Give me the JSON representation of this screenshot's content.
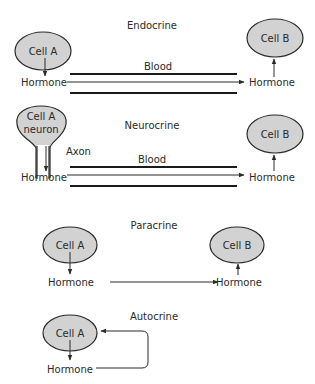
{
  "diagram": {
    "type": "cell-signaling-modes",
    "colors": {
      "cell_fill": "#d2d2d2",
      "stroke": "#2a2a2a",
      "background": "#ffffff"
    },
    "panels": [
      {
        "title": "Endocrine",
        "source_cell": "Cell A",
        "target_cell": "Cell B",
        "source_product": "Hormone",
        "target_product": "Hormone",
        "vessel_label": "Blood"
      },
      {
        "title": "Neurocrine",
        "source_cell_line1": "Cell A",
        "source_cell_line2": "neuron",
        "axon_label": "Axon",
        "target_cell": "Cell B",
        "source_product": "Hormone",
        "target_product": "Hormone",
        "vessel_label": "Blood"
      },
      {
        "title": "Paracrine",
        "source_cell": "Cell A",
        "target_cell": "Cell B",
        "source_product": "Hormone",
        "target_product": "Hormone"
      },
      {
        "title": "Autocrine",
        "source_cell": "Cell A",
        "source_product": "Hormone"
      }
    ]
  }
}
